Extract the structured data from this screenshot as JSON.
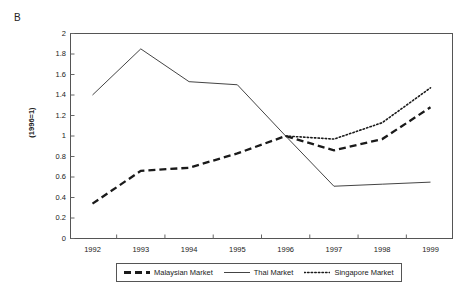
{
  "panel": {
    "label": "B"
  },
  "chart_data": {
    "type": "line",
    "title": "",
    "xlabel": "",
    "ylabel": "(1996=1)",
    "categories": [
      "1992",
      "1993",
      "1994",
      "1995",
      "1996",
      "1997",
      "1998",
      "1999"
    ],
    "x": [
      1992,
      1993,
      1994,
      1995,
      1996,
      1997,
      1998,
      1999
    ],
    "ylim": [
      0,
      2
    ],
    "ytick_labels": [
      "0",
      "0.2",
      "0.4",
      "0.6",
      "0.8",
      "1",
      "1.2",
      "1.4",
      "1.6",
      "1.8",
      "2"
    ],
    "ytick_values": [
      0,
      0.2,
      0.4,
      0.6,
      0.8,
      1,
      1.2,
      1.4,
      1.6,
      1.8,
      2
    ],
    "grid": false,
    "legend_position": "bottom",
    "series": [
      {
        "name": "Malaysian Market",
        "style": "dashed",
        "color": "#1a1a1a",
        "values": [
          0.34,
          0.66,
          0.69,
          0.83,
          1.0,
          0.86,
          0.97,
          1.28
        ]
      },
      {
        "name": "Thai Market",
        "style": "solid",
        "color": "#444444",
        "values": [
          1.4,
          1.85,
          1.53,
          1.5,
          1.0,
          0.51,
          0.53,
          0.55
        ]
      },
      {
        "name": "Singapore Market",
        "style": "dotted",
        "color": "#1a1a1a",
        "values": [
          null,
          null,
          null,
          null,
          1.0,
          0.97,
          1.13,
          1.47
        ]
      }
    ]
  }
}
